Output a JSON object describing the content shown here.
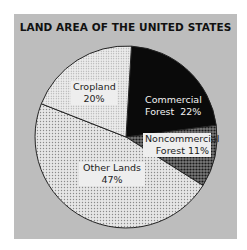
{
  "chart_data": {
    "type": "pie",
    "title": "LAND AREA OF THE UNITED STATES",
    "categories": [
      "Commercial Forest",
      "Noncommercial Forest",
      "Other Lands",
      "Cropland"
    ],
    "values": [
      22,
      11,
      47,
      20
    ],
    "unit": "%",
    "slices": [
      {
        "label": "Commercial Forest",
        "value": 22,
        "display": "Commercial Forest 22%",
        "fill": "#0a0a0a",
        "pattern": "solid black"
      },
      {
        "label": "Noncommercial Forest",
        "value": 11,
        "display": "Noncommercial Forest 11%",
        "fill": "#555555",
        "pattern": "dark dotted screen"
      },
      {
        "label": "Other Lands",
        "value": 47,
        "display": "Other Lands 47%",
        "fill": "#d8d8d8",
        "pattern": "light dotted screen"
      },
      {
        "label": "Cropland",
        "value": 20,
        "display": "Cropland 20%",
        "fill": "#dedede",
        "pattern": "fine light dotted screen"
      }
    ],
    "start_angle": "12 o'clock",
    "direction": "clockwise",
    "legend": "none (labels inside slices)"
  },
  "labels": {
    "title": "LAND AREA OF THE UNITED STATES",
    "commercial_line1": "Commercial",
    "commercial_line2": "Forest  22%",
    "noncommercial_line1": "Noncommercial",
    "noncommercial_line2": "Forest 11%",
    "other_line1": "Other Lands",
    "other_line2": "47%",
    "cropland_line1": "Cropland",
    "cropland_line2": "20%"
  },
  "colors": {
    "panel_bg": "#bdbdbd",
    "commercial": "#0a0a0a",
    "noncommercial": "#555555",
    "other": "#d8d8d8",
    "cropland": "#dedede",
    "outline": "#222222"
  }
}
